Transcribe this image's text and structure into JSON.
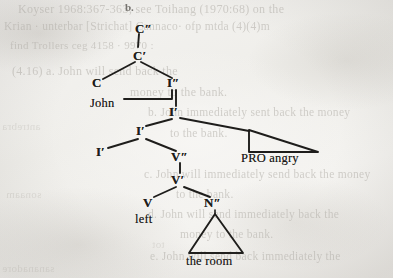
{
  "page": {
    "width": 393,
    "height": 278,
    "background_color": "#f3f2f0",
    "ink_color": "#1e1d1b",
    "ghost_color": "#b9b6b0",
    "kind": "scanned-book-page-syntax-tree"
  },
  "example_label": "b.",
  "tree": {
    "description": "X-bar syntax tree for the sentence 'John left the room angry'",
    "nodes": [
      {
        "id": "cmax",
        "label": "C″",
        "x": 135,
        "y": 28
      },
      {
        "id": "cbar",
        "label": "C′",
        "x": 133,
        "y": 55
      },
      {
        "id": "c",
        "label": "C",
        "x": 92,
        "y": 82
      },
      {
        "id": "imax",
        "label": "I″",
        "x": 172,
        "y": 83
      },
      {
        "id": "ibar1",
        "label": "I′",
        "x": 172,
        "y": 112
      },
      {
        "id": "ibar2",
        "label": "I′",
        "x": 140,
        "y": 131
      },
      {
        "id": "i",
        "label": "I′",
        "x": 98,
        "y": 152
      },
      {
        "id": "vmax",
        "label": "V″",
        "x": 176,
        "y": 157
      },
      {
        "id": "vbar",
        "label": "V′",
        "x": 176,
        "y": 180
      },
      {
        "id": "v",
        "label": "V",
        "x": 145,
        "y": 202
      },
      {
        "id": "nmax",
        "label": "N″",
        "x": 209,
        "y": 203
      }
    ],
    "leaves": [
      {
        "id": "john",
        "label": "John",
        "x": 92,
        "y": 103
      },
      {
        "id": "left",
        "label": "left",
        "x": 137,
        "y": 219
      },
      {
        "id": "proangry",
        "label": "PRO angry",
        "x": 240,
        "y": 158
      },
      {
        "id": "theroom",
        "label": "the room",
        "x": 193,
        "y": 262
      }
    ],
    "triangles": [
      {
        "id": "pro-angry-triangle",
        "shape": "right-triangle",
        "apex_x": 249,
        "apex_y": 130,
        "base_left_x": 249,
        "base_left_y": 152,
        "base_right_x": 318,
        "base_right_y": 152
      },
      {
        "id": "the-room-triangle",
        "shape": "isosceles-triangle",
        "apex_x": 215,
        "apex_y": 214,
        "base_left_x": 189,
        "base_left_y": 253,
        "base_right_x": 243,
        "base_right_y": 253
      }
    ]
  },
  "bleed_through_text": [
    {
      "id": "g1",
      "text": "Koyser 1968:367-363; see Toihang (1970:68) on the",
      "x": 18,
      "y": 2,
      "size": 12,
      "mirror": false
    },
    {
      "id": "g2",
      "text": "Krian · unterbar [Strichat] Cannaco· ofp   mtda (4)(4)m",
      "x": 4,
      "y": 20,
      "size": 11.5,
      "mirror": false
    },
    {
      "id": "g3",
      "text": "find Trollers ceg 4158 · 9970 :",
      "x": 10,
      "y": 39,
      "size": 11,
      "mirror": false
    },
    {
      "id": "g4",
      "text": "(4.16) a. John will send back the",
      "x": 12,
      "y": 64,
      "size": 12,
      "mirror": false
    },
    {
      "id": "g5",
      "text": "money to the bank.",
      "x": 130,
      "y": 85,
      "size": 12,
      "mirror": false
    },
    {
      "id": "g6",
      "text": "b. John immediately sent back the money",
      "x": 148,
      "y": 106,
      "size": 11.5,
      "mirror": false
    },
    {
      "id": "g7",
      "text": "to the bank.",
      "x": 170,
      "y": 127,
      "size": 11.5,
      "mirror": false
    },
    {
      "id": "g8",
      "text": "c. John will immediately send back the money",
      "x": 144,
      "y": 168,
      "size": 11.5,
      "mirror": false
    },
    {
      "id": "g9",
      "text": "to the bank.",
      "x": 176,
      "y": 188,
      "size": 11.5,
      "mirror": false
    },
    {
      "id": "g10",
      "text": "d. John will send immediately back the",
      "x": 148,
      "y": 208,
      "size": 11.5,
      "mirror": false
    },
    {
      "id": "g11",
      "text": "money to the bank.",
      "x": 180,
      "y": 228,
      "size": 11.5,
      "mirror": false
    },
    {
      "id": "g12",
      "text": "e. John will send back immediately the",
      "x": 150,
      "y": 250,
      "size": 11.5,
      "mirror": false
    },
    {
      "id": "g13",
      "text": "antrebra",
      "x": 2,
      "y": 120,
      "size": 11,
      "mirror": true
    },
    {
      "id": "g14",
      "text": "sonaam",
      "x": 6,
      "y": 188,
      "size": 11,
      "mirror": true
    },
    {
      "id": "g15",
      "text": "sananadore",
      "x": 2,
      "y": 262,
      "size": 11,
      "mirror": true
    },
    {
      "id": "g16",
      "text": "tot",
      "x": 152,
      "y": 238,
      "size": 11,
      "mirror": true
    }
  ]
}
